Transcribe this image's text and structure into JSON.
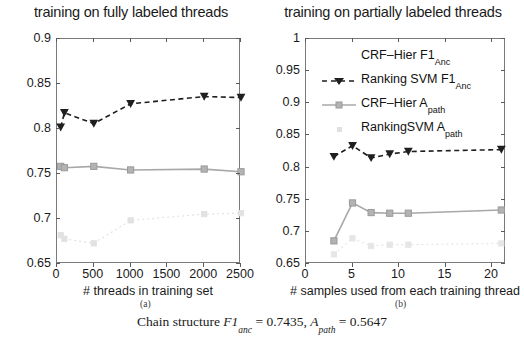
{
  "figure": {
    "sublabel_a": "(a)",
    "sublabel_b": "(b)",
    "caption": {
      "prefix": "Chain structure ",
      "metric1_name": "F1",
      "metric1_sub": "anc",
      "metric1_eq": " = 0.7435, ",
      "metric2_name": "A",
      "metric2_sub": "path",
      "metric2_eq": " = 0.5647"
    }
  },
  "legend": {
    "entries": [
      {
        "label": "CRF–Hier F1",
        "sub": "Anc",
        "marker": "dashed-triangle-dark",
        "color": "#1f1f1f"
      },
      {
        "label": "Ranking SVM F1",
        "sub": "Anc",
        "marker": "dashed-triangle-dark",
        "color": "#1f1f1f"
      },
      {
        "label": "CRF–Hier A",
        "sub": "path",
        "marker": "solid-square-gray",
        "color": "#a8a8a8"
      },
      {
        "label": "RankingSVM A",
        "sub": "path",
        "marker": "dotted-faint",
        "color": "#dcdcdc"
      }
    ]
  },
  "chart_data": [
    {
      "type": "line",
      "id": "panel-a",
      "title": "training on fully labeled threads",
      "xlabel": "# threads in training set",
      "ylabel": "",
      "xlim": [
        0,
        2500
      ],
      "ylim": [
        0.65,
        0.9
      ],
      "xticks": [
        0,
        500,
        1000,
        1500,
        2000,
        2500
      ],
      "xticklabels": [
        "0",
        "500",
        "1000",
        "1500",
        "2000",
        "2500"
      ],
      "yticks": [
        0.65,
        0.7,
        0.75,
        0.8,
        0.85,
        0.9
      ],
      "yticklabels": [
        "0.65",
        "0.7",
        "0.75",
        "0.8",
        "0.85",
        "0.9"
      ],
      "grid": false,
      "legend_position": "none",
      "series": [
        {
          "name": "Ranking SVM F1_Anc",
          "style": "dashed-triangle-dark",
          "color": "#1f1f1f",
          "x": [
            50,
            100,
            500,
            1000,
            2000,
            2500
          ],
          "y": [
            0.802,
            0.818,
            0.806,
            0.828,
            0.836,
            0.835
          ]
        },
        {
          "name": "CRF-Hier A_path",
          "style": "solid-square-gray",
          "color": "#a8a8a8",
          "x": [
            50,
            100,
            500,
            1000,
            2000,
            2500
          ],
          "y": [
            0.7585,
            0.757,
            0.7585,
            0.7545,
            0.7555,
            0.7525
          ]
        },
        {
          "name": "RankingSVM A_path",
          "style": "dotted-faint",
          "color": "#e2e2e2",
          "x": [
            50,
            100,
            500,
            1000,
            2000,
            2500
          ],
          "y": [
            0.682,
            0.678,
            0.673,
            0.6985,
            0.7055,
            0.7065
          ]
        }
      ]
    },
    {
      "type": "line",
      "id": "panel-b",
      "title": "training on partially labeled threads",
      "xlabel": "# samples used from each training thread",
      "ylabel": "",
      "xlim": [
        0,
        21.5
      ],
      "ylim": [
        0.65,
        1.0
      ],
      "xticks": [
        0,
        5,
        10,
        15,
        20
      ],
      "xticklabels": [
        "0",
        "5",
        "10",
        "15",
        "20"
      ],
      "yticks": [
        0.65,
        0.7,
        0.75,
        0.8,
        0.85,
        0.9,
        0.95,
        1.0
      ],
      "yticklabels": [
        "0.65",
        "0.7",
        "0.75",
        "0.8",
        "0.85",
        "0.9",
        "0.95",
        "1"
      ],
      "grid": false,
      "legend_position": "upper-left-inside",
      "series": [
        {
          "name": "Ranking SVM F1_Anc",
          "style": "dashed-triangle-dark",
          "color": "#1f1f1f",
          "x": [
            3,
            5,
            7,
            9,
            11,
            21
          ],
          "y": [
            0.817,
            0.834,
            0.815,
            0.821,
            0.825,
            0.828
          ]
        },
        {
          "name": "CRF-Hier A_path",
          "style": "solid-square-gray",
          "color": "#a8a8a8",
          "x": [
            3,
            5,
            7,
            9,
            11,
            21
          ],
          "y": [
            0.686,
            0.745,
            0.73,
            0.729,
            0.729,
            0.734
          ]
        },
        {
          "name": "RankingSVM A_path",
          "style": "dotted-faint",
          "color": "#e6e6e6",
          "x": [
            3,
            5,
            7,
            9,
            11,
            21
          ],
          "y": [
            0.665,
            0.69,
            0.678,
            0.68,
            0.68,
            0.682
          ]
        }
      ]
    }
  ]
}
